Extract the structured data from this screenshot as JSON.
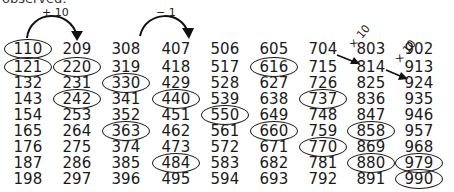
{
  "caption": "observed:",
  "annotations": {
    "arc1_label": "+ 10",
    "arc2_label": "− 1",
    "diag1_label": "× 10",
    "diag2_label": "× 10"
  },
  "columns": [
    {
      "cells": [
        {
          "v": "110",
          "c": true
        },
        {
          "v": "121",
          "c": true
        },
        {
          "v": "132",
          "c": false
        },
        {
          "v": "143",
          "c": false
        },
        {
          "v": "154",
          "c": false
        },
        {
          "v": "165",
          "c": false
        },
        {
          "v": "176",
          "c": false
        },
        {
          "v": "187",
          "c": false
        },
        {
          "v": "198",
          "c": false
        }
      ]
    },
    {
      "cells": [
        {
          "v": "209",
          "c": false
        },
        {
          "v": "220",
          "c": true
        },
        {
          "v": "231",
          "c": false
        },
        {
          "v": "242",
          "c": true
        },
        {
          "v": "253",
          "c": false
        },
        {
          "v": "264",
          "c": false
        },
        {
          "v": "275",
          "c": false
        },
        {
          "v": "286",
          "c": false
        },
        {
          "v": "297",
          "c": false
        }
      ]
    },
    {
      "cells": [
        {
          "v": "308",
          "c": false
        },
        {
          "v": "319",
          "c": false
        },
        {
          "v": "330",
          "c": true
        },
        {
          "v": "341",
          "c": false
        },
        {
          "v": "352",
          "c": false
        },
        {
          "v": "363",
          "c": true
        },
        {
          "v": "374",
          "c": false
        },
        {
          "v": "385",
          "c": false
        },
        {
          "v": "396",
          "c": false
        }
      ]
    },
    {
      "cells": [
        {
          "v": "407",
          "c": false
        },
        {
          "v": "418",
          "c": false
        },
        {
          "v": "429",
          "c": false
        },
        {
          "v": "440",
          "c": true
        },
        {
          "v": "451",
          "c": false
        },
        {
          "v": "462",
          "c": false
        },
        {
          "v": "473",
          "c": false
        },
        {
          "v": "484",
          "c": true
        },
        {
          "v": "495",
          "c": false
        }
      ]
    },
    {
      "cells": [
        {
          "v": "506",
          "c": false
        },
        {
          "v": "517",
          "c": false
        },
        {
          "v": "528",
          "c": false
        },
        {
          "v": "539",
          "c": false
        },
        {
          "v": "550",
          "c": true
        },
        {
          "v": "561",
          "c": false
        },
        {
          "v": "572",
          "c": false
        },
        {
          "v": "583",
          "c": false
        },
        {
          "v": "594",
          "c": false
        }
      ]
    },
    {
      "cells": [
        {
          "v": "605",
          "c": false
        },
        {
          "v": "616",
          "c": true
        },
        {
          "v": "627",
          "c": false
        },
        {
          "v": "638",
          "c": false
        },
        {
          "v": "649",
          "c": false
        },
        {
          "v": "660",
          "c": true
        },
        {
          "v": "671",
          "c": false
        },
        {
          "v": "682",
          "c": false
        },
        {
          "v": "693",
          "c": false
        }
      ]
    },
    {
      "cells": [
        {
          "v": "704",
          "c": false
        },
        {
          "v": "715",
          "c": false
        },
        {
          "v": "726",
          "c": false
        },
        {
          "v": "737",
          "c": true
        },
        {
          "v": "748",
          "c": false
        },
        {
          "v": "759",
          "c": false
        },
        {
          "v": "770",
          "c": true
        },
        {
          "v": "781",
          "c": false
        },
        {
          "v": "792",
          "c": false
        }
      ]
    },
    {
      "cells": [
        {
          "v": "803",
          "c": false
        },
        {
          "v": "814",
          "c": false
        },
        {
          "v": "825",
          "c": false
        },
        {
          "v": "836",
          "c": false
        },
        {
          "v": "847",
          "c": false
        },
        {
          "v": "858",
          "c": true
        },
        {
          "v": "869",
          "c": false
        },
        {
          "v": "880",
          "c": true
        },
        {
          "v": "891",
          "c": false
        }
      ]
    },
    {
      "cells": [
        {
          "v": "902",
          "c": false
        },
        {
          "v": "913",
          "c": false
        },
        {
          "v": "924",
          "c": false
        },
        {
          "v": "935",
          "c": false
        },
        {
          "v": "946",
          "c": false
        },
        {
          "v": "957",
          "c": false
        },
        {
          "v": "968",
          "c": false
        },
        {
          "v": "979",
          "c": true
        },
        {
          "v": "990",
          "c": true
        }
      ]
    }
  ]
}
